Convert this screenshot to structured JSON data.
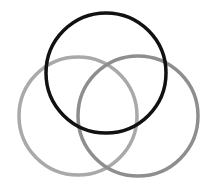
{
  "diagram": {
    "type": "venn",
    "background": "#ffffff",
    "circles": [
      {
        "id": "left",
        "cx": 78,
        "cy": 116,
        "r": 59,
        "stroke": "#a9a9a9",
        "stroke_width": 3.5
      },
      {
        "id": "right",
        "cx": 138,
        "cy": 116,
        "r": 60,
        "stroke": "#8e8e8e",
        "stroke_width": 3.5
      },
      {
        "id": "top",
        "cx": 106,
        "cy": 73,
        "r": 60,
        "stroke": "#111111",
        "stroke_width": 3.5
      }
    ]
  }
}
